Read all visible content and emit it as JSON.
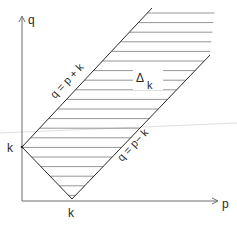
{
  "diagram": {
    "axes": {
      "vertical_label": "q",
      "horizontal_label": "p"
    },
    "points": {
      "q_intercept_label": "k",
      "p_intercept_label": "k"
    },
    "lines": {
      "upper_label": "q = p + k",
      "lower_label": "q = p− k"
    },
    "region": {
      "symbol": "Δ",
      "subscript": "k"
    },
    "colors": {
      "ink": "#2a2a2a",
      "axis": "#6e6e6e",
      "hatch": "#8a8a8a",
      "stray_line": "#d0d0d0"
    }
  }
}
